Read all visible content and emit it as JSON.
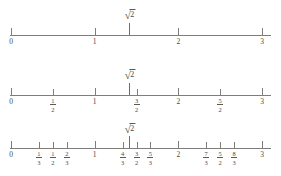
{
  "figure": {
    "axis_color": "#7d7d7d",
    "text_color": "#4a4a4a",
    "axis_min": 0,
    "axis_max": 3,
    "root_symbol": "√",
    "root_radicand": "2",
    "root_label": "√2",
    "root_value": 1.41421356
  },
  "lines": [
    {
      "name": "integer-number-line",
      "y": 35,
      "root_tick_value": 1.41421356,
      "root_label_y": 10,
      "ticks": [
        {
          "value": 0,
          "label": "0",
          "type": "integer",
          "size": "major"
        },
        {
          "value": 1,
          "label": "1",
          "type": "integer",
          "size": "major"
        },
        {
          "value": 2,
          "label": "2",
          "type": "integer",
          "size": "major"
        },
        {
          "value": 3,
          "label": "3",
          "type": "integer",
          "size": "major"
        }
      ]
    },
    {
      "name": "halves-number-line",
      "y": 95,
      "root_tick_value": 1.41421356,
      "root_label_y": 70,
      "ticks": [
        {
          "value": 0,
          "label": "0",
          "type": "integer",
          "size": "major"
        },
        {
          "value": 0.5,
          "num": "1",
          "den": "2",
          "type": "fraction",
          "size": "minor"
        },
        {
          "value": 1,
          "label": "1",
          "type": "integer",
          "size": "major"
        },
        {
          "value": 1.5,
          "num": "3",
          "den": "2",
          "type": "fraction",
          "size": "minor"
        },
        {
          "value": 2,
          "label": "2",
          "type": "integer",
          "size": "major"
        },
        {
          "value": 2.5,
          "num": "5",
          "den": "2",
          "type": "fraction",
          "size": "minor"
        },
        {
          "value": 3,
          "label": "3",
          "type": "integer",
          "size": "major"
        }
      ]
    },
    {
      "name": "thirds-and-halves-number-line",
      "y": 148,
      "root_tick_value": 1.41421356,
      "root_label_y": 124,
      "ticks": [
        {
          "value": 0,
          "label": "0",
          "type": "integer",
          "size": "major"
        },
        {
          "value": 0.3333333,
          "num": "1",
          "den": "3",
          "type": "fraction",
          "size": "minor"
        },
        {
          "value": 0.5,
          "num": "1",
          "den": "2",
          "type": "fraction",
          "size": "minor"
        },
        {
          "value": 0.6666667,
          "num": "2",
          "den": "3",
          "type": "fraction",
          "size": "minor"
        },
        {
          "value": 1,
          "label": "1",
          "type": "integer",
          "size": "major"
        },
        {
          "value": 1.3333333,
          "num": "4",
          "den": "3",
          "type": "fraction",
          "size": "minor"
        },
        {
          "value": 1.5,
          "num": "3",
          "den": "2",
          "type": "fraction",
          "size": "minor"
        },
        {
          "value": 1.6666667,
          "num": "5",
          "den": "3",
          "type": "fraction",
          "size": "minor"
        },
        {
          "value": 2,
          "label": "2",
          "type": "integer",
          "size": "major"
        },
        {
          "value": 2.3333333,
          "num": "7",
          "den": "3",
          "type": "fraction",
          "size": "minor"
        },
        {
          "value": 2.5,
          "num": "5",
          "den": "2",
          "type": "fraction",
          "size": "minor"
        },
        {
          "value": 2.6666667,
          "num": "8",
          "den": "3",
          "type": "fraction",
          "size": "minor"
        },
        {
          "value": 3,
          "label": "3",
          "type": "integer",
          "size": "major"
        }
      ]
    }
  ],
  "geometry": {
    "x_left": 11,
    "x_right": 262
  }
}
